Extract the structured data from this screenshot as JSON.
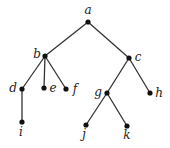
{
  "diagram": {
    "type": "rooted-tree",
    "colors": {
      "edge": "#333333",
      "node": "#111111",
      "label": "#222222",
      "background": "#ffffff"
    },
    "nodes": [
      {
        "id": "a",
        "label": "a",
        "x": 88,
        "y": 22,
        "lx": 88,
        "ly": 14,
        "anchor": "middle"
      },
      {
        "id": "b",
        "label": "b",
        "x": 45,
        "y": 56,
        "lx": 37,
        "ly": 58,
        "anchor": "middle"
      },
      {
        "id": "c",
        "label": "c",
        "x": 129,
        "y": 58,
        "lx": 138,
        "ly": 61,
        "anchor": "middle"
      },
      {
        "id": "d",
        "label": "d",
        "x": 22,
        "y": 89,
        "lx": 13,
        "ly": 92,
        "anchor": "middle"
      },
      {
        "id": "e",
        "label": "e",
        "x": 44,
        "y": 88,
        "lx": 53,
        "ly": 92,
        "anchor": "middle"
      },
      {
        "id": "f",
        "label": "f",
        "x": 66,
        "y": 89,
        "lx": 75,
        "ly": 93,
        "anchor": "middle"
      },
      {
        "id": "g",
        "label": "g",
        "x": 107,
        "y": 93,
        "lx": 98,
        "ly": 96,
        "anchor": "middle"
      },
      {
        "id": "h",
        "label": "h",
        "x": 150,
        "y": 93,
        "lx": 159,
        "ly": 97,
        "anchor": "middle"
      },
      {
        "id": "i",
        "label": "i",
        "x": 22,
        "y": 122,
        "lx": 21,
        "ly": 136,
        "anchor": "middle"
      },
      {
        "id": "j",
        "label": "j",
        "x": 86,
        "y": 125,
        "lx": 84,
        "ly": 138,
        "anchor": "middle"
      },
      {
        "id": "k",
        "label": "k",
        "x": 127,
        "y": 126,
        "lx": 127,
        "ly": 139,
        "anchor": "middle"
      }
    ],
    "edges": [
      [
        "a",
        "b"
      ],
      [
        "a",
        "c"
      ],
      [
        "b",
        "d"
      ],
      [
        "b",
        "e"
      ],
      [
        "b",
        "f"
      ],
      [
        "c",
        "g"
      ],
      [
        "c",
        "h"
      ],
      [
        "d",
        "i"
      ],
      [
        "g",
        "j"
      ],
      [
        "g",
        "k"
      ]
    ]
  }
}
